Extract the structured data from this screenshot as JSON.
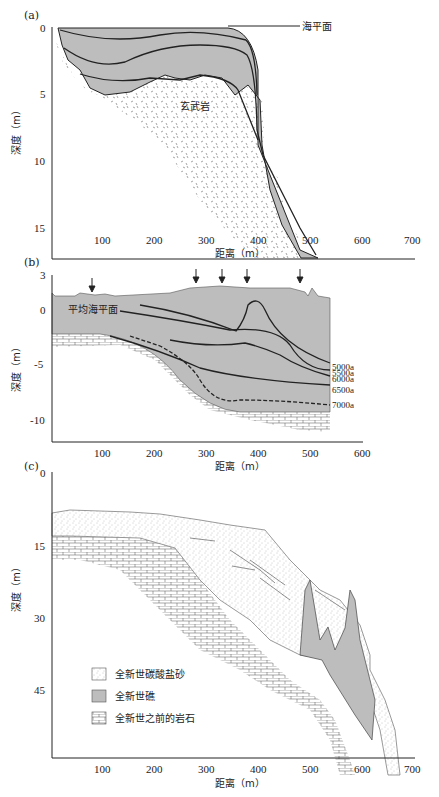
{
  "panels": {
    "a": {
      "label": "(a)",
      "sea_level_label": "海平面",
      "rock_label": "玄武岩",
      "ylabel": "深度（m）",
      "xlabel": "距离（m）",
      "yticks": [
        "0",
        "5",
        "10",
        "15"
      ],
      "xticks": [
        "100",
        "200",
        "300",
        "400",
        "500",
        "600",
        "700"
      ]
    },
    "b": {
      "label": "(b)",
      "msl_label": "平均海平面",
      "ylabel": "深度（m）",
      "xlabel": "距离（m）",
      "yticks": [
        "3",
        "0",
        "-5",
        "-10"
      ],
      "xticks": [
        "100",
        "200",
        "300",
        "400",
        "500",
        "600"
      ],
      "age_lines": [
        "5000a",
        "5500a",
        "6000a",
        "6500a",
        "7000a"
      ]
    },
    "c": {
      "label": "(c)",
      "ylabel": "深度（m）",
      "xlabel": "距离（m）",
      "yticks": [
        "0",
        "15",
        "30",
        "45"
      ],
      "xticks": [
        "100",
        "200",
        "300",
        "400",
        "500",
        "600",
        "700"
      ],
      "legend": [
        {
          "pattern": "dots",
          "label": "全新世碳酸盐砂"
        },
        {
          "pattern": "gray",
          "label": "全新世礁"
        },
        {
          "pattern": "brick",
          "label": "全新世之前的岩石"
        }
      ]
    }
  },
  "colors": {
    "reef_gray": "#bdbdbd",
    "line": "#222222",
    "background": "#ffffff"
  }
}
